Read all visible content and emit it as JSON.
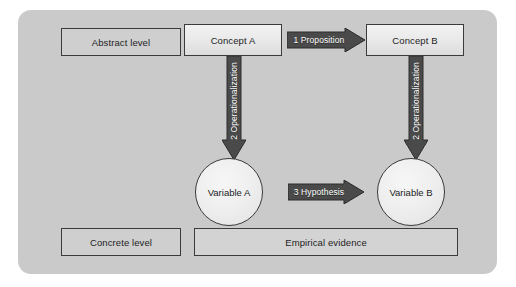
{
  "diagram": {
    "panel_bg": "#cacaca",
    "arrow_color": "#4a4a4a",
    "node_border": "#3b3b3b",
    "levels": {
      "abstract": "Abstract level",
      "concrete": "Concrete level"
    },
    "concepts": {
      "a": "Concept A",
      "b": "Concept B"
    },
    "variables": {
      "a": "Variable A",
      "b": "Variable B"
    },
    "relations": {
      "proposition": "1 Proposition",
      "operationalization_a": "2 Operationalization",
      "operationalization_b": "2 Operationalization",
      "hypothesis": "3 Hypothesis"
    },
    "evidence": "Empirical evidence"
  }
}
